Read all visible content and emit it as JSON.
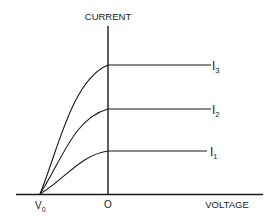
{
  "diagram": {
    "type": "iv-characteristic",
    "y_axis_label": "CURRENT",
    "x_axis_label": "VOLTAGE",
    "x_ticks": [
      {
        "label": "V",
        "subscript": "0"
      },
      {
        "label": "O"
      }
    ],
    "curves": [
      {
        "name": "I",
        "subscript": "3",
        "saturation_level": "high"
      },
      {
        "name": "I",
        "subscript": "2",
        "saturation_level": "medium"
      },
      {
        "name": "I",
        "subscript": "1",
        "saturation_level": "low"
      }
    ],
    "colors": {
      "line": "#1a1a1a",
      "background": "#ffffff"
    }
  }
}
